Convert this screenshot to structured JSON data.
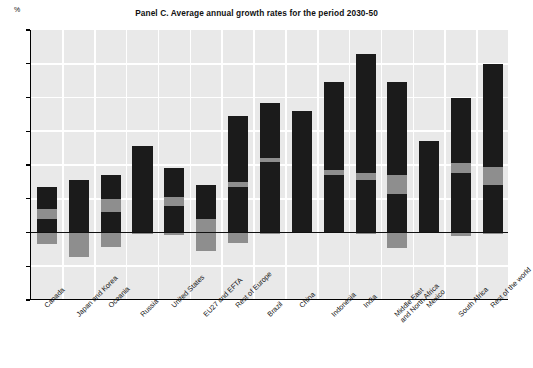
{
  "chart_data": {
    "type": "bar",
    "title": "Panel C. Average annual growth rates for the period 2030-50",
    "xlabel": "",
    "ylabel": "%",
    "ylim": [
      -2,
      6
    ],
    "yticks": [
      6,
      5,
      4,
      3,
      2,
      1,
      0,
      -1,
      -2
    ],
    "grid": true,
    "legend": "none",
    "stacked": true,
    "categories": [
      "Canada",
      "Japan and Korea",
      "Oceania",
      "Russia",
      "United States",
      "EU27 and EFTA",
      "Rest of Europe",
      "Brazil",
      "China",
      "Indonesia",
      "India",
      "Middle East\nand North Africa",
      "Mexico",
      "South Africa",
      "Rest of the world"
    ],
    "series": [
      {
        "name": "lower-dark",
        "color": "#1b1b1b",
        "values": [
          0.4,
          1.55,
          0.6,
          1.0,
          0.8,
          0.0,
          1.35,
          2.1,
          1.05,
          1.7,
          1.55,
          1.15,
          1.2,
          1.75,
          1.4
        ]
      },
      {
        "name": "middle-gray",
        "color": "#8e8e8e",
        "values": [
          0.3,
          0.0,
          0.4,
          0.0,
          0.25,
          0.4,
          0.15,
          0.1,
          0.0,
          0.15,
          0.2,
          0.55,
          0.0,
          0.3,
          0.55
        ]
      },
      {
        "name": "upper-dark",
        "color": "#1b1b1b",
        "values": [
          0.65,
          0.0,
          0.7,
          1.55,
          0.85,
          1.0,
          1.95,
          1.65,
          2.55,
          2.6,
          3.55,
          2.75,
          1.5,
          1.95,
          3.05
        ]
      },
      {
        "name": "negative-gray",
        "color": "#8e8e8e",
        "values": [
          -0.35,
          -0.72,
          -0.42,
          -0.05,
          -0.08,
          -0.55,
          -0.3,
          -0.05,
          0.0,
          0.0,
          -0.05,
          -0.45,
          0.0,
          -0.1,
          -0.05
        ]
      }
    ],
    "totals": [
      1.35,
      1.55,
      1.7,
      2.55,
      1.9,
      1.4,
      3.45,
      3.85,
      3.6,
      4.45,
      5.3,
      4.45,
      2.7,
      4.0,
      5.0
    ]
  },
  "colors": {
    "plot_background": "#e9e9e9",
    "gridline": "#ffffff",
    "dark_segment": "#1b1b1b",
    "gray_segment": "#8e8e8e",
    "axis": "#000000"
  }
}
